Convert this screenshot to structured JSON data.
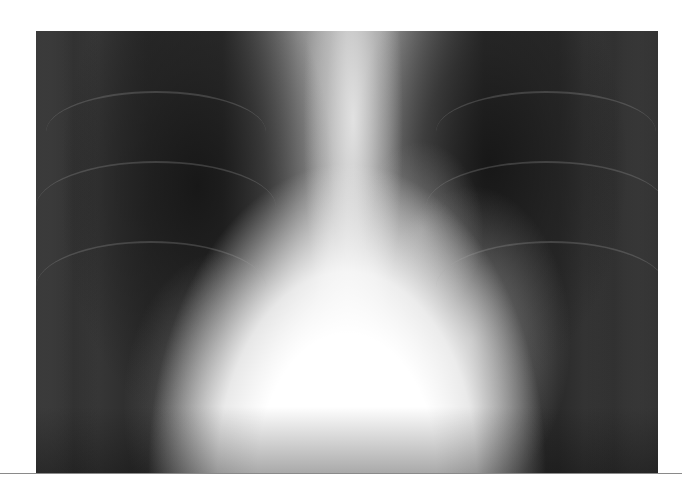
{
  "image": {
    "subject": "chest radiograph (frontal view)",
    "alt": "Frontal chest X-ray showing enlarged cardiac silhouette and bilateral hazy lung opacities",
    "colors": {
      "lung_dark": "#2a2a2a",
      "heart_bright": "#ffffff",
      "background": "#ffffff",
      "rule": "#8a8a8a"
    }
  }
}
